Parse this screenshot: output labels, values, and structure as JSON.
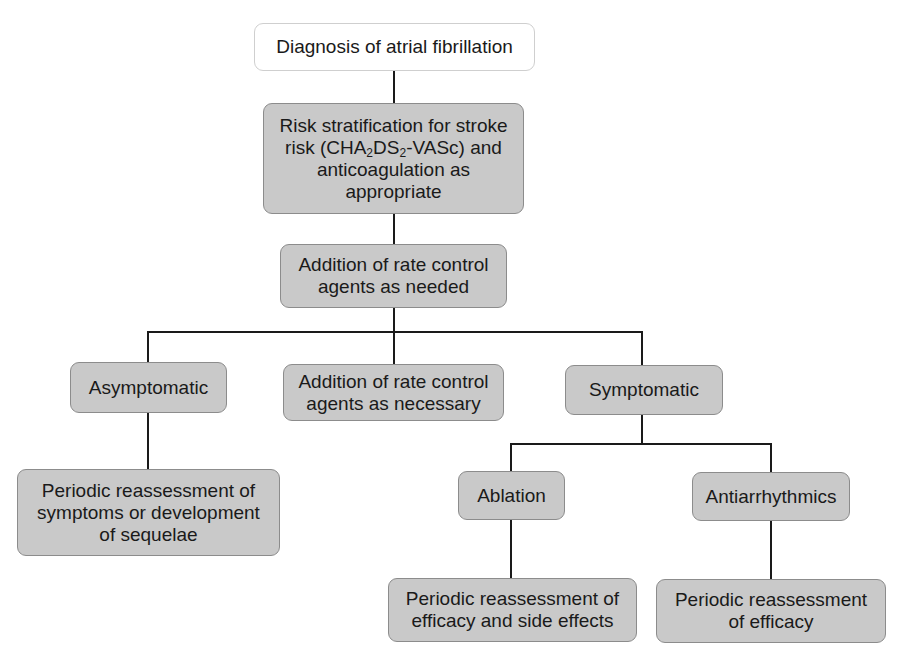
{
  "diagram": {
    "type": "flowchart",
    "colors": {
      "node_fill": "#c9c9c9",
      "node_border": "#8c8c8c",
      "start_fill": "#ffffff",
      "start_border": "#cfcfcf",
      "text": "#1a1a1a",
      "line": "#1a1a1a"
    },
    "nodes": {
      "diagnosis": {
        "label": "Diagnosis of atrial fibrillation"
      },
      "risk": {
        "line1": "Risk stratification for stroke",
        "line2_pre": "risk (CHA",
        "line2_sub1": "2",
        "line2_mid": "DS",
        "line2_sub2": "2",
        "line2_post": "-VASc) and",
        "line3": "anticoagulation as",
        "line4": "appropriate"
      },
      "rate_control": {
        "line1": "Addition of rate control",
        "line2": "agents as needed"
      },
      "asymptomatic": {
        "label": "Asymptomatic"
      },
      "rate_control_necessary": {
        "line1": "Addition of rate control",
        "line2": "agents as necessary"
      },
      "symptomatic": {
        "label": "Symptomatic"
      },
      "periodic_symptoms": {
        "line1": "Periodic reassessment of",
        "line2": "symptoms or development",
        "line3": "of sequelae"
      },
      "ablation": {
        "label": "Ablation"
      },
      "antiarrhythmics": {
        "label": "Antiarrhythmics"
      },
      "periodic_efficacy_side": {
        "line1": "Periodic reassessment of",
        "line2": "efficacy and side effects"
      },
      "periodic_efficacy": {
        "line1": "Periodic reassessment",
        "line2": "of efficacy"
      }
    },
    "edges": [
      [
        "diagnosis",
        "risk"
      ],
      [
        "risk",
        "rate_control"
      ],
      [
        "rate_control",
        "asymptomatic"
      ],
      [
        "rate_control",
        "rate_control_necessary"
      ],
      [
        "rate_control",
        "symptomatic"
      ],
      [
        "asymptomatic",
        "periodic_symptoms"
      ],
      [
        "symptomatic",
        "ablation"
      ],
      [
        "symptomatic",
        "antiarrhythmics"
      ],
      [
        "ablation",
        "periodic_efficacy_side"
      ],
      [
        "antiarrhythmics",
        "periodic_efficacy"
      ]
    ]
  }
}
